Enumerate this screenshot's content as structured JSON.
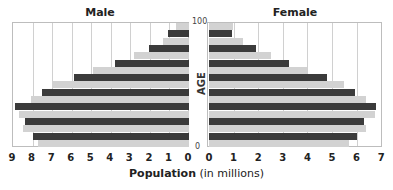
{
  "chart_data": {
    "type": "bar",
    "subtype": "population-pyramid",
    "xlabel_bold": "Population",
    "xlabel_rest": " (in millions)",
    "ylabel": "AGE",
    "y_ticks": [
      "100",
      "0"
    ],
    "panels": [
      {
        "name": "Male",
        "title": "Male",
        "x_ticks": [
          9,
          8,
          7,
          6,
          5,
          4,
          3,
          2,
          1,
          0
        ],
        "xlim": [
          9,
          0
        ],
        "series": [
          {
            "name": "light",
            "color": "#d2d2d2",
            "values_top_to_bottom": [
              0.66,
              1.33,
              2.8,
              4.9,
              7.0,
              8.1,
              8.7,
              8.5,
              7.7
            ]
          },
          {
            "name": "dark",
            "color": "#3b3b3b",
            "values_top_to_bottom": [
              1.07,
              2.05,
              3.8,
              5.9,
              7.5,
              8.9,
              8.4,
              8.0
            ]
          }
        ]
      },
      {
        "name": "Female",
        "title": "Female",
        "x_ticks": [
          0,
          1,
          2,
          3,
          4,
          5,
          6,
          7
        ],
        "xlim": [
          0,
          7
        ],
        "series": [
          {
            "name": "light",
            "color": "#d2d2d2",
            "values_top_to_bottom": [
              0.98,
              1.4,
              2.5,
              4.0,
              5.5,
              6.4,
              6.75,
              6.4,
              5.7
            ]
          },
          {
            "name": "dark",
            "color": "#3b3b3b",
            "values_top_to_bottom": [
              0.95,
              1.9,
              3.25,
              4.8,
              5.95,
              6.8,
              6.3,
              6.0
            ]
          }
        ]
      }
    ],
    "grid": true,
    "legend": null
  }
}
